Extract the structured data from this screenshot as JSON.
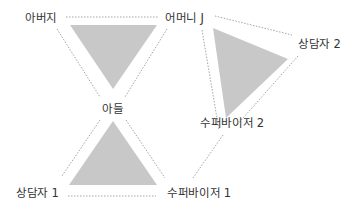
{
  "diagram": {
    "type": "triangles-relationship",
    "colors": {
      "triangle_fill": "#c8c8c8",
      "dotted_line": "#9a9a9a",
      "label_text": "#333333"
    },
    "labels": {
      "father": "아버지",
      "mother": "어머니 J",
      "son": "아들",
      "counselor1": "상담자 1",
      "supervisor1": "수퍼바이저 1",
      "counselor2": "상담자 2",
      "supervisor2": "수퍼바이저 2"
    },
    "triangles": [
      {
        "name": "family-triangle",
        "vertices": [
          "아버지",
          "어머니 J",
          "아들"
        ],
        "orientation": "inverted"
      },
      {
        "name": "counseling-triangle-1",
        "vertices": [
          "아들",
          "상담자 1",
          "수퍼바이저 1"
        ],
        "orientation": "upright"
      },
      {
        "name": "counseling-triangle-2",
        "vertices": [
          "어머니 J",
          "상담자 2",
          "수퍼바이저 2"
        ],
        "orientation": "rotated"
      }
    ],
    "connections": [
      {
        "from": "아버지",
        "to": "어머니 J"
      },
      {
        "from": "아버지",
        "to": "아들"
      },
      {
        "from": "어머니 J",
        "to": "아들"
      },
      {
        "from": "아들",
        "to": "상담자 1"
      },
      {
        "from": "아들",
        "to": "수퍼바이저 1"
      },
      {
        "from": "상담자 1",
        "to": "수퍼바이저 1"
      },
      {
        "from": "어머니 J",
        "to": "상담자 2"
      },
      {
        "from": "어머니 J",
        "to": "수퍼바이저 2"
      },
      {
        "from": "상담자 2",
        "to": "수퍼바이저 2"
      },
      {
        "from": "수퍼바이저 2",
        "to": "수퍼바이저 1"
      }
    ]
  }
}
